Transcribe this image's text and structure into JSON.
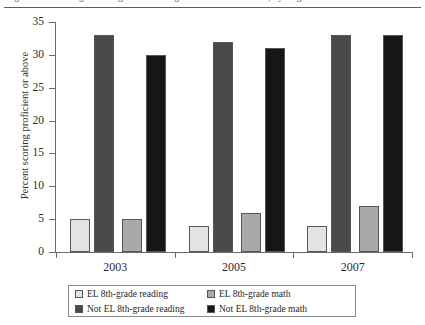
{
  "figure": {
    "caption_sliver": "Figure 1. Percentage of 8th-graders scoring at or above Proficient, by English learner status",
    "ylabel": "Percent scoring proficient or above"
  },
  "legend": {
    "items": [
      {
        "label": "EL 8th-grade reading",
        "color": "#e3e3e3",
        "key": "el_reading"
      },
      {
        "label": "EL 8th-grade math",
        "color": "#a9a9a9",
        "key": "el_math"
      },
      {
        "label": "Not EL 8th-grade reading",
        "color": "#4a4a4a",
        "key": "notel_reading"
      },
      {
        "label": "Not EL 8th-grade math",
        "color": "#161616",
        "key": "notel_math"
      }
    ]
  },
  "chart_data": {
    "type": "bar",
    "title": "",
    "xlabel": "",
    "ylabel": "Percent scoring proficient or above",
    "categories": [
      "2003",
      "2005",
      "2007"
    ],
    "xticklabels": [
      "2003",
      "2005",
      "2007"
    ],
    "yticks": [
      0,
      5,
      10,
      15,
      20,
      25,
      30,
      35
    ],
    "yticklabels": [
      "0",
      "5",
      "10",
      "15",
      "20",
      "25",
      "30",
      "35"
    ],
    "ylim": [
      0,
      35
    ],
    "grid": false,
    "legend_position": "below-axes",
    "series": [
      {
        "name": "EL 8th-grade reading",
        "color": "#e3e3e3",
        "values": [
          5,
          4,
          4
        ]
      },
      {
        "name": "Not EL 8th-grade reading",
        "color": "#4a4a4a",
        "values": [
          33,
          32,
          33
        ]
      },
      {
        "name": "EL 8th-grade math",
        "color": "#a9a9a9",
        "values": [
          5,
          6,
          7
        ]
      },
      {
        "name": "Not EL 8th-grade math",
        "color": "#161616",
        "values": [
          30,
          31,
          33
        ]
      }
    ],
    "bars": [
      {
        "group": "2003",
        "series": "EL 8th-grade reading",
        "value": 5,
        "color": "#e3e3e3"
      },
      {
        "group": "2003",
        "series": "Not EL 8th-grade reading",
        "value": 33,
        "color": "#4a4a4a"
      },
      {
        "group": "2003",
        "series": "EL 8th-grade math",
        "value": 5,
        "color": "#a9a9a9"
      },
      {
        "group": "2003",
        "series": "Not EL 8th-grade math",
        "value": 30,
        "color": "#161616"
      },
      {
        "group": "2005",
        "series": "EL 8th-grade reading",
        "value": 4,
        "color": "#e3e3e3"
      },
      {
        "group": "2005",
        "series": "Not EL 8th-grade reading",
        "value": 32,
        "color": "#4a4a4a"
      },
      {
        "group": "2005",
        "series": "EL 8th-grade math",
        "value": 6,
        "color": "#a9a9a9"
      },
      {
        "group": "2005",
        "series": "Not EL 8th-grade math",
        "value": 31,
        "color": "#161616"
      },
      {
        "group": "2007",
        "series": "EL 8th-grade reading",
        "value": 4,
        "color": "#e3e3e3"
      },
      {
        "group": "2007",
        "series": "Not EL 8th-grade reading",
        "value": 33,
        "color": "#4a4a4a"
      },
      {
        "group": "2007",
        "series": "EL 8th-grade math",
        "value": 7,
        "color": "#a9a9a9"
      },
      {
        "group": "2007",
        "series": "Not EL 8th-grade math",
        "value": 33,
        "color": "#161616"
      }
    ]
  }
}
